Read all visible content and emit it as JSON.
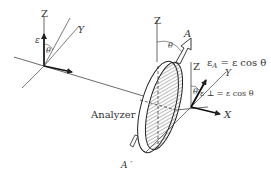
{
  "figure": {
    "left_axes": {
      "z_label": "Z",
      "y_label": "Y",
      "field_label": "ε",
      "angle_label": "θ"
    },
    "analyzer": {
      "label": "Analyzer",
      "z_label": "Z",
      "axis_label": "A",
      "axis_label_prime": "A ′",
      "angle_label": "θ"
    },
    "right_axes": {
      "z_label": "Z",
      "y_label": "Y",
      "x_label": "X",
      "angle_label": "θ",
      "equation_top": "εA = ε cos θ",
      "equation_top_main": "ε",
      "equation_top_sub": "A",
      "equation_top_rest": " = ε cos θ",
      "equation_bottom": "ε ⊥ = ε cos θ"
    },
    "colors": {
      "line": "#333333",
      "hatch": "#555555"
    }
  }
}
